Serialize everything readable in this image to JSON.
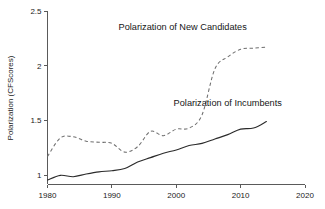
{
  "chart_data": {
    "type": "line",
    "title": "",
    "xlabel": "",
    "ylabel": "Polarization (CFScores)",
    "xlim": [
      1980,
      2020
    ],
    "ylim": [
      0.8,
      2.5
    ],
    "grid": false,
    "legend_position": "inline-annotations",
    "xticks": [
      "1980",
      "1990",
      "2000",
      "2010",
      "2020"
    ],
    "xtick_values": [
      1980,
      1990,
      2000,
      2010,
      2020
    ],
    "yticks": [
      "1",
      "1.5",
      "2",
      "2.5"
    ],
    "ytick_values": [
      1,
      1.5,
      2,
      2.5
    ],
    "annotations": [
      {
        "text": "Polarization of New Candidates",
        "x": 2001,
        "y": 2.33
      },
      {
        "text": "Polarization of Incumbents",
        "x": 2008,
        "y": 1.63
      }
    ],
    "series": [
      {
        "name": "Polarization of New Candidates",
        "style": "dashed",
        "color": "#6f6f6f",
        "x": [
          1980,
          1982,
          1984,
          1986,
          1988,
          1990,
          1992,
          1994,
          1996,
          1998,
          2000,
          2002,
          2004,
          2006,
          2008,
          2010,
          2012,
          2014
        ],
        "values": [
          1.17,
          1.34,
          1.35,
          1.31,
          1.3,
          1.29,
          1.21,
          1.26,
          1.4,
          1.36,
          1.42,
          1.43,
          1.55,
          1.97,
          2.08,
          2.15,
          2.16,
          2.17
        ]
      },
      {
        "name": "Polarization of Incumbents",
        "style": "solid",
        "color": "#2b2b2b",
        "x": [
          1980,
          1982,
          1984,
          1986,
          1988,
          1990,
          1992,
          1994,
          1996,
          1998,
          2000,
          2002,
          2004,
          2006,
          2008,
          2010,
          2012,
          2014
        ],
        "values": [
          0.955,
          0.998,
          0.985,
          1.01,
          1.03,
          1.04,
          1.06,
          1.12,
          1.16,
          1.2,
          1.23,
          1.27,
          1.29,
          1.33,
          1.37,
          1.42,
          1.43,
          1.49
        ]
      }
    ]
  },
  "axis": {
    "y_title": "Polarization (CFScores)"
  }
}
